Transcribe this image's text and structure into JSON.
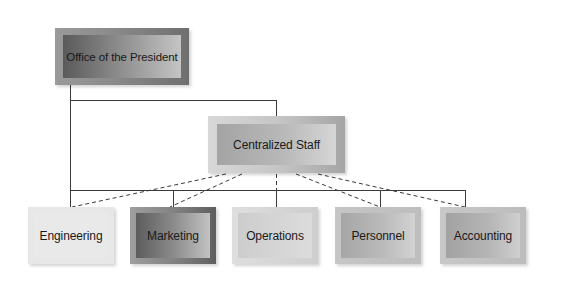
{
  "diagram": {
    "type": "organization-chart",
    "nodes": {
      "president": {
        "label": "Office of the President"
      },
      "staff": {
        "label": "Centralized Staff"
      },
      "engineering": {
        "label": "Engineering"
      },
      "marketing": {
        "label": "Marketing"
      },
      "operations": {
        "label": "Operations"
      },
      "personnel": {
        "label": "Personnel"
      },
      "accounting": {
        "label": "Accounting"
      }
    },
    "edges": [
      {
        "from": "Office of the President",
        "to": "Centralized Staff",
        "style": "solid"
      },
      {
        "from": "Office of the President",
        "to": "Engineering",
        "style": "solid"
      },
      {
        "from": "Office of the President",
        "to": "Marketing",
        "style": "solid"
      },
      {
        "from": "Office of the President",
        "to": "Operations",
        "style": "solid"
      },
      {
        "from": "Office of the President",
        "to": "Personnel",
        "style": "solid"
      },
      {
        "from": "Office of the President",
        "to": "Accounting",
        "style": "solid"
      },
      {
        "from": "Centralized Staff",
        "to": "Engineering",
        "style": "dashed"
      },
      {
        "from": "Centralized Staff",
        "to": "Marketing",
        "style": "dashed"
      },
      {
        "from": "Centralized Staff",
        "to": "Operations",
        "style": "dashed"
      },
      {
        "from": "Centralized Staff",
        "to": "Personnel",
        "style": "dashed"
      },
      {
        "from": "Centralized Staff",
        "to": "Accounting",
        "style": "dashed"
      }
    ],
    "colors": {
      "line": "#3a3a3a",
      "background": "#ffffff"
    }
  }
}
